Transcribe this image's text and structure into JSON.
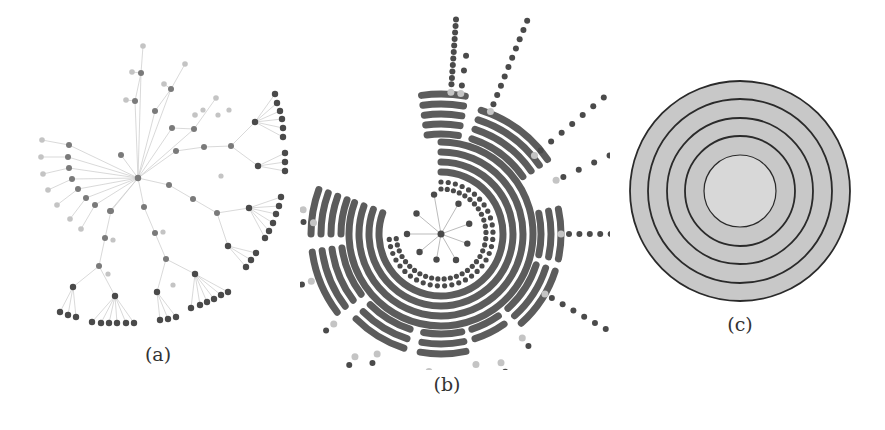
{
  "figure": {
    "panels": [
      {
        "id": "a",
        "caption": "(a)",
        "description": "radial tree layout, partial fan"
      },
      {
        "id": "b",
        "caption": "(b)",
        "description": "radial tree with dense concentric arc bands"
      },
      {
        "id": "c",
        "caption": "(c)",
        "description": "concentric circles, level rings"
      }
    ]
  },
  "colors": {
    "node_dark": "#4a4a4a",
    "node_mid": "#7a7a7a",
    "node_light": "#c4c4c4",
    "edge": "#cfcfcf",
    "band": "#5c5c5c",
    "ring_fill": "#c8c8c8",
    "inner_fill": "#d8d8d8",
    "ring_stroke": "#2a2a2a"
  },
  "panel_c": {
    "center": [
      740,
      191
    ],
    "radii": [
      110,
      92,
      73,
      55,
      36
    ]
  }
}
